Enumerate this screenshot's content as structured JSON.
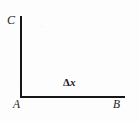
{
  "figure": {
    "type": "line-diagram",
    "background_color": "#fdfdfd",
    "ink_color": "#161616"
  },
  "axes": {
    "vertical": {
      "name": "vertical-axis",
      "from_label": "A",
      "to_label": "C"
    },
    "horizontal": {
      "name": "horizontal-axis",
      "from_label": "A",
      "to_label": "B"
    }
  },
  "labels": {
    "c": "C",
    "a": "A",
    "b": "B",
    "delta_symbol": "Δ",
    "delta_variable": "x",
    "delta_x": "Δx"
  }
}
